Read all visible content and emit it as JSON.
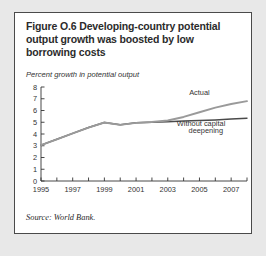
{
  "figure": {
    "title": "Figure O.6  Developing-country potential output growth was boosted by low borrowing costs",
    "axis_note": "Percent growth in potential output",
    "source": "Source: World Bank."
  },
  "chart_data": {
    "type": "line",
    "title": "Figure O.6  Developing-country potential output growth was boosted by low borrowing costs",
    "subtitle": "Percent growth in potential output",
    "xlabel": "",
    "ylabel": "Percent growth in potential output",
    "xlim": [
      1995,
      2008
    ],
    "ylim": [
      0,
      8
    ],
    "ytick_labels": [
      "0",
      "1",
      "2",
      "3",
      "4",
      "5",
      "6",
      "7",
      "8"
    ],
    "ytick_values": [
      0,
      1,
      2,
      3,
      4,
      5,
      6,
      7,
      8
    ],
    "xtick_labels": [
      "1995",
      "1997",
      "1999",
      "2001",
      "2003",
      "2005",
      "2007"
    ],
    "xtick_values": [
      1995,
      1997,
      1999,
      2001,
      2003,
      2005,
      2007
    ],
    "xtick_minor_values": [
      1996,
      1998,
      2000,
      2002,
      2004,
      2006,
      2008
    ],
    "grid": false,
    "legend_position": "inline-annotation",
    "x": [
      1995,
      1996,
      1997,
      1998,
      1999,
      2000,
      2001,
      2002,
      2003,
      2004,
      2005,
      2006,
      2007,
      2008
    ],
    "series": [
      {
        "name": "Actual",
        "color": "#9a9a9a",
        "values": [
          3.05,
          3.55,
          4.05,
          4.55,
          4.98,
          4.78,
          4.95,
          5.02,
          5.15,
          5.45,
          5.85,
          6.25,
          6.55,
          6.8
        ],
        "label_x": 2005.0,
        "label_y": 7.35
      },
      {
        "name": "Without capital deepening",
        "color": "#4a4a4a",
        "values": [
          3.05,
          3.55,
          4.05,
          4.55,
          4.98,
          4.78,
          4.95,
          5.0,
          5.05,
          5.1,
          5.15,
          5.2,
          5.28,
          5.35
        ],
        "label_x": 2005.1,
        "label_y": 4.72
      }
    ],
    "annotations": [
      {
        "text": "Actual",
        "x": 2005.0,
        "y": 7.35
      },
      {
        "text": "Without capital",
        "x": 2005.1,
        "y": 4.72
      },
      {
        "text": "deepening",
        "x": 2005.4,
        "y": 4.08
      }
    ]
  }
}
